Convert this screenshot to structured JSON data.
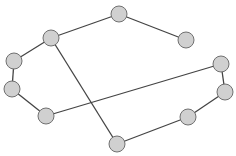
{
  "graph": {
    "nodes": [
      {
        "id": "A",
        "x": 119,
        "y": 14
      },
      {
        "id": "B",
        "x": 186,
        "y": 40
      },
      {
        "id": "C",
        "x": 51,
        "y": 38
      },
      {
        "id": "D",
        "x": 14,
        "y": 61
      },
      {
        "id": "E",
        "x": 12,
        "y": 89
      },
      {
        "id": "F",
        "x": 46,
        "y": 116
      },
      {
        "id": "G",
        "x": 221,
        "y": 64
      },
      {
        "id": "H",
        "x": 225,
        "y": 92
      },
      {
        "id": "I",
        "x": 188,
        "y": 117
      },
      {
        "id": "J",
        "x": 117,
        "y": 144
      }
    ],
    "edges": [
      [
        "A",
        "B"
      ],
      [
        "A",
        "C"
      ],
      [
        "C",
        "D"
      ],
      [
        "D",
        "E"
      ],
      [
        "E",
        "F"
      ],
      [
        "F",
        "G"
      ],
      [
        "G",
        "H"
      ],
      [
        "H",
        "I"
      ],
      [
        "I",
        "J"
      ],
      [
        "J",
        "C"
      ]
    ],
    "node_radius": 8,
    "colors": {
      "node_fill": "#d0d0d0",
      "node_stroke": "#707070",
      "edge": "#444444"
    }
  }
}
